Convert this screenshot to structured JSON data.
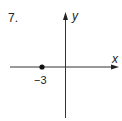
{
  "problem": {
    "number": "7.",
    "x_axis_label": "x",
    "y_axis_label": "y",
    "point_label": "−3",
    "point_value": -3
  },
  "colors": {
    "ink": "#222222",
    "background": "#ffffff"
  }
}
